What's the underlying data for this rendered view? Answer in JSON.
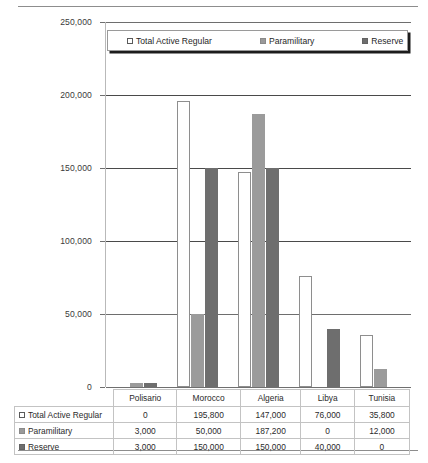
{
  "chart_data": {
    "type": "bar",
    "title": "",
    "xlabel": "",
    "ylabel": "",
    "ylim": [
      0,
      250000
    ],
    "ytick_labels": [
      "0",
      "50,000",
      "100,000",
      "150,000",
      "200,000",
      "250,000"
    ],
    "ytick_values": [
      0,
      50000,
      100000,
      150000,
      200000,
      250000
    ],
    "grid": true,
    "legend_position": "top-inside",
    "categories": [
      "Polisario",
      "Morocco",
      "Algeria",
      "Libya",
      "Tunisia"
    ],
    "series": [
      {
        "name": "Total Active Regular",
        "color": "#ffffff",
        "swatch": "sw-white",
        "values": [
          0,
          195800,
          147000,
          76000,
          35800
        ],
        "labels": [
          "0",
          "195,800",
          "147,000",
          "76,000",
          "35,800"
        ]
      },
      {
        "name": "Paramilitary",
        "color": "#9b9b9b",
        "swatch": "sw-mid",
        "values": [
          3000,
          50000,
          187200,
          0,
          12000
        ],
        "labels": [
          "3,000",
          "50,000",
          "187,200",
          "0",
          "12,000"
        ]
      },
      {
        "name": "Reserve",
        "color": "#6e6e6e",
        "swatch": "sw-dark",
        "values": [
          3000,
          150000,
          150000,
          40000,
          0
        ],
        "labels": [
          "3,000",
          "150,000",
          "150,000",
          "40,000",
          "0"
        ]
      }
    ]
  },
  "legend": {
    "items": [
      {
        "label": "Total Active Regular"
      },
      {
        "label": "Paramilitary"
      },
      {
        "label": "Reserve"
      }
    ]
  },
  "data_table": {
    "column_headers": [
      "Polisario",
      "Morocco",
      "Algeria",
      "Libya",
      "Tunisia"
    ],
    "rows": [
      {
        "label": "Total Active Regular",
        "cells": [
          "0",
          "195,800",
          "147,000",
          "76,000",
          "35,800"
        ]
      },
      {
        "label": "Paramilitary",
        "cells": [
          "3,000",
          "50,000",
          "187,200",
          "0",
          "12,000"
        ]
      },
      {
        "label": "Reserve",
        "cells": [
          "3,000",
          "150,000",
          "150,000",
          "40,000",
          "0"
        ]
      }
    ]
  }
}
